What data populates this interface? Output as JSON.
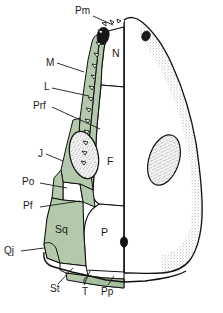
{
  "figure": {
    "kind": "anatomical-line-drawing",
    "orientation": "dorsal",
    "colors": {
      "shaded_bone_fill": "#b4c8ac",
      "shaded_bone_fill_dark": "#a8bfa0",
      "unshaded_bone_fill": "#ffffff",
      "outline": "#111111",
      "stipple": "#6b6b6b",
      "foramen_fill": "#1a1a1a",
      "background": "#ffffff",
      "leader_line": "#1a1a1a",
      "label_text": "#1a1a1a"
    }
  },
  "labels": {
    "callouts": [
      {
        "id": "pm",
        "text": "Pm",
        "x": 75,
        "y": 10,
        "name": "premaxilla"
      },
      {
        "id": "m",
        "text": "M",
        "x": 46,
        "y": 63,
        "name": "maxilla"
      },
      {
        "id": "l",
        "text": "L",
        "x": 43,
        "y": 86,
        "name": "lacrimal"
      },
      {
        "id": "prf",
        "text": "Prf",
        "x": 35,
        "y": 104,
        "name": "prefrontal"
      },
      {
        "id": "j",
        "text": "J",
        "x": 37,
        "y": 153,
        "name": "jugal"
      },
      {
        "id": "po",
        "text": "Po",
        "x": 23,
        "y": 181,
        "name": "postorbital"
      },
      {
        "id": "pf",
        "text": "Pf",
        "x": 25,
        "y": 205,
        "name": "postfrontal"
      },
      {
        "id": "qj",
        "text": "Qj",
        "x": 5,
        "y": 250,
        "name": "quadratojugal"
      },
      {
        "id": "st",
        "text": "St",
        "x": 50,
        "y": 287,
        "name": "supratemporal"
      },
      {
        "id": "t",
        "text": "T",
        "x": 81,
        "y": 290,
        "name": "tabular"
      },
      {
        "id": "pp",
        "text": "Pp",
        "x": 101,
        "y": 290,
        "name": "postparietal"
      }
    ],
    "inline": [
      {
        "id": "n",
        "text": "N",
        "x": 113,
        "y": 52,
        "name": "nasal"
      },
      {
        "id": "f",
        "text": "F",
        "x": 107,
        "y": 160,
        "name": "frontal"
      },
      {
        "id": "sq",
        "text": "Sq",
        "x": 55,
        "y": 228,
        "name": "squamosal"
      },
      {
        "id": "p",
        "text": "P",
        "x": 100,
        "y": 231,
        "name": "parietal"
      }
    ]
  },
  "features": {
    "orbits": [
      {
        "side": "left",
        "cx": 84,
        "cy": 155,
        "rx": 14,
        "ry": 24,
        "rot": -14,
        "texture": "stipple"
      },
      {
        "side": "right",
        "cx": 164,
        "cy": 160,
        "rx": 15,
        "ry": 26,
        "rot": 18,
        "texture": "stipple"
      }
    ],
    "nares": [
      {
        "side": "left",
        "cx": 106,
        "cy": 36,
        "r": 4
      },
      {
        "side": "right",
        "cx": 146,
        "cy": 36,
        "r": 3.5
      }
    ],
    "pineal_foramen": {
      "cx": 124,
      "cy": 242,
      "rx": 3.5,
      "ry": 5
    },
    "marginal_teeth_count": 13
  }
}
